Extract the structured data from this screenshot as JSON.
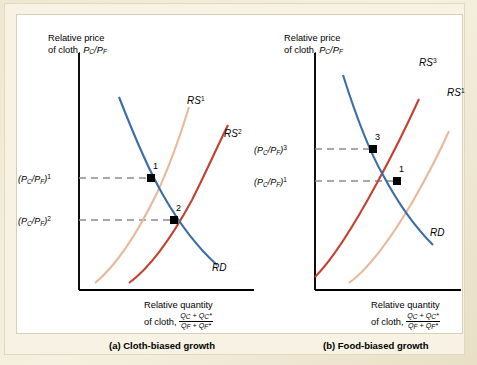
{
  "figure": {
    "background_color": "#f7f2e3",
    "panel_color": "#ffffff"
  },
  "colors": {
    "rd_curve": "#3b6ea5",
    "rs_light": "#e8b89a",
    "rs_dark": "#c4402f",
    "axis": "#000000",
    "dashed_guide": "#8c8c8c",
    "point_marker": "#000000"
  },
  "panels": [
    {
      "id": "a",
      "caption": "(a) Cloth-biased growth",
      "y_axis": {
        "label_line1": "Relative price",
        "label_line2_prefix": "of cloth, ",
        "label_line2_symbol": "P_C/P_F",
        "tick_labels": [
          {
            "text": "(P_C/P_F)1",
            "superscript": "1"
          },
          {
            "text": "(P_C/P_F)2",
            "superscript": "2"
          }
        ]
      },
      "x_axis": {
        "label_line1": "Relative quantity",
        "label_line2_prefix": "of cloth, ",
        "fraction_numerator": "Q_C + Q*_C",
        "fraction_denominator": "Q_F + Q*_F"
      },
      "curves": [
        {
          "name": "RS1",
          "label": "RS",
          "superscript": "1",
          "color": "#e8b89a",
          "type": "relative-supply"
        },
        {
          "name": "RS2",
          "label": "RS",
          "superscript": "2",
          "color": "#c4402f",
          "type": "relative-supply"
        },
        {
          "name": "RD",
          "label": "RD",
          "superscript": "",
          "color": "#3b6ea5",
          "type": "relative-demand"
        }
      ],
      "equilibria": [
        {
          "label": "1",
          "price_level": "(P_C/P_F)1"
        },
        {
          "label": "2",
          "price_level": "(P_C/P_F)2"
        }
      ]
    },
    {
      "id": "b",
      "caption": "(b) Food-biased growth",
      "y_axis": {
        "label_line1": "Relative price",
        "label_line2_prefix": "of cloth, ",
        "label_line2_symbol": "P_C/P_F",
        "tick_labels": [
          {
            "text": "(P_C/P_F)3",
            "superscript": "3"
          },
          {
            "text": "(P_C/P_F)1",
            "superscript": "1"
          }
        ]
      },
      "x_axis": {
        "label_line1": "Relative quantity",
        "label_line2_prefix": "of cloth, ",
        "fraction_numerator": "Q_C + Q*_C",
        "fraction_denominator": "Q_F + Q*_F"
      },
      "curves": [
        {
          "name": "RS3",
          "label": "RS",
          "superscript": "3",
          "color": "#c4402f",
          "type": "relative-supply"
        },
        {
          "name": "RS1",
          "label": "RS",
          "superscript": "1",
          "color": "#e8b89a",
          "type": "relative-supply"
        },
        {
          "name": "RD",
          "label": "RD",
          "superscript": "",
          "color": "#3b6ea5",
          "type": "relative-demand"
        }
      ],
      "equilibria": [
        {
          "label": "3",
          "price_level": "(P_C/P_F)3"
        },
        {
          "label": "1",
          "price_level": "(P_C/P_F)1"
        }
      ]
    }
  ],
  "symbols": {
    "P": "P",
    "Q": "Q",
    "sub_C": "C",
    "sub_F": "F",
    "star": "*",
    "RS": "RS",
    "RD": "RD"
  }
}
